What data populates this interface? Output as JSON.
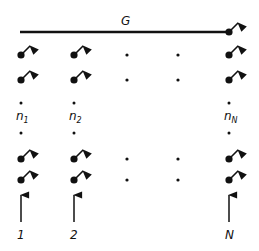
{
  "diagram": {
    "bus_label": "G",
    "columns": [
      {
        "id": "1",
        "x": 21,
        "label": "1",
        "counter_base": "n",
        "counter_sub": "1",
        "type": "spins"
      },
      {
        "id": "2",
        "x": 74,
        "label": "2",
        "counter_base": "n",
        "counter_sub": "2",
        "type": "spins"
      },
      {
        "id": "ellipsis-a",
        "x": 127,
        "type": "ellipsis"
      },
      {
        "id": "ellipsis-b",
        "x": 178,
        "type": "ellipsis"
      },
      {
        "id": "N",
        "x": 229,
        "label": "N",
        "counter_base": "n",
        "counter_sub": "N",
        "type": "spins"
      }
    ],
    "spin_rows_y": [
      55,
      80,
      159,
      180
    ],
    "colors": {
      "ink": "#111111",
      "background": "#ffffff"
    }
  }
}
